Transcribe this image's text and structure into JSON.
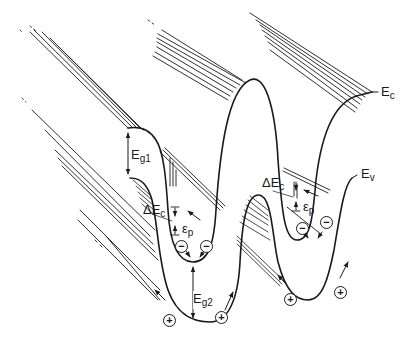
{
  "figure": {
    "type": "energy band diagram"
  },
  "labels": {
    "ec": {
      "main": "E",
      "sub": "c"
    },
    "ev": {
      "main": "E",
      "sub": "v"
    },
    "eg1": {
      "main": "E",
      "sub": "g1"
    },
    "eg2": {
      "main": "E",
      "sub": "g2"
    },
    "delta_ec_left": {
      "main": "ΔE",
      "sub": "c"
    },
    "delta_ec_right": {
      "main": "ΔE",
      "sub": "c"
    },
    "eps_p_left": {
      "main": "ε",
      "sub": "p"
    },
    "eps_p_right": {
      "main": "ε",
      "sub": "p"
    }
  },
  "charges": {
    "electron_symbol": "−",
    "hole_symbol": "+",
    "electrons": 4,
    "holes": 4
  },
  "colors": {
    "ink": "#1a1a1a",
    "background": "#ffffff"
  }
}
